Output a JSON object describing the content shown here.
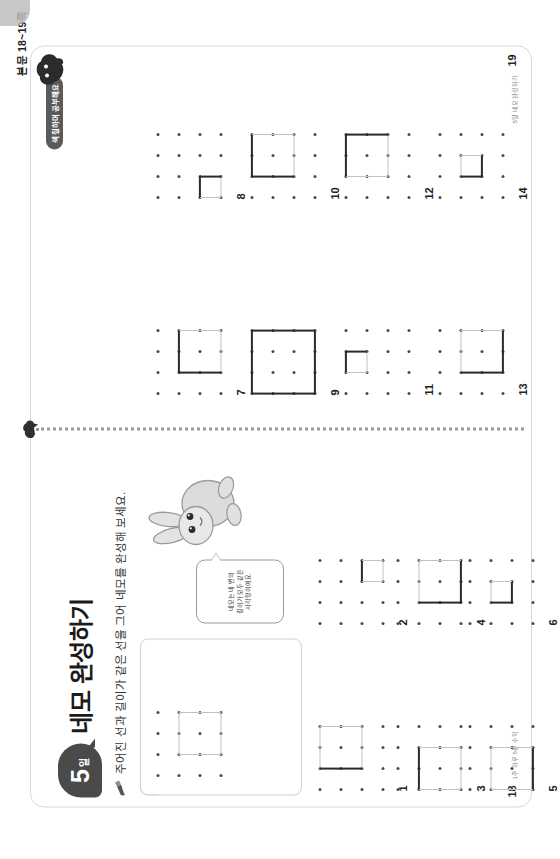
{
  "meta": {
    "runhead": "본문 18~19쪽",
    "rotation_deg": -90
  },
  "day_badge": {
    "number": "5",
    "unit": "일"
  },
  "title": "네모 완성하기",
  "instruction": "주어진 선과 길이가 같은 선을 그어 네모를 완성해 보세요.",
  "tab_pill": "색칠하며 공부해요",
  "bubble_text": "네모는 네 변의\n길이가 모두 같은\n사각형이에요.",
  "pages": {
    "left": {
      "number": "18",
      "sub": "1주 하루 5분 수학"
    },
    "right": {
      "number": "19",
      "sub": "5일 네모 완성하기"
    }
  },
  "icons": {
    "pencil": "pencil-icon",
    "rabbit": "rabbit-mascot-icon",
    "blob": "mascot-blob-icon"
  },
  "problems": [
    {
      "id": "example",
      "label": "",
      "cols": 4,
      "rows": 4,
      "square": {
        "c0": 1,
        "r0": 1,
        "w": 2,
        "h": 2
      },
      "given": [],
      "missing": [
        "top",
        "right",
        "bottom",
        "left"
      ]
    },
    {
      "id": "1",
      "label": "1",
      "cols": 4,
      "rows": 4,
      "square": {
        "c0": 1,
        "r0": 0,
        "w": 2,
        "h": 2
      },
      "given": [
        "left"
      ],
      "missing": [
        "top",
        "right",
        "bottom"
      ]
    },
    {
      "id": "2",
      "label": "2",
      "cols": 4,
      "rows": 4,
      "square": {
        "c0": 2,
        "r0": 2,
        "w": 1,
        "h": 1
      },
      "given": [
        "top"
      ],
      "missing": [
        "right",
        "bottom",
        "left"
      ]
    },
    {
      "id": "3",
      "label": "3",
      "cols": 4,
      "rows": 4,
      "square": {
        "c0": 0,
        "r0": 1,
        "w": 2,
        "h": 2
      },
      "given": [
        "top"
      ],
      "missing": [
        "right",
        "bottom",
        "left"
      ]
    },
    {
      "id": "4",
      "label": "4",
      "cols": 4,
      "rows": 4,
      "square": {
        "c0": 1,
        "r0": 1,
        "w": 2,
        "h": 2
      },
      "given": [
        "left",
        "bottom"
      ],
      "missing": [
        "top",
        "right"
      ]
    },
    {
      "id": "5",
      "label": "5",
      "cols": 4,
      "rows": 4,
      "square": {
        "c0": 0,
        "r0": 1,
        "w": 2,
        "h": 2
      },
      "given": [
        "bottom"
      ],
      "missing": [
        "top",
        "right",
        "left"
      ]
    },
    {
      "id": "6",
      "label": "6",
      "cols": 4,
      "rows": 4,
      "square": {
        "c0": 1,
        "r0": 1,
        "w": 1,
        "h": 1
      },
      "given": [
        "left",
        "bottom"
      ],
      "missing": [
        "top",
        "right"
      ]
    },
    {
      "id": "7",
      "label": "7",
      "cols": 4,
      "rows": 4,
      "square": {
        "c0": 1,
        "r0": 1,
        "w": 2,
        "h": 2
      },
      "given": [
        "top",
        "left"
      ],
      "missing": [
        "right",
        "bottom"
      ]
    },
    {
      "id": "8",
      "label": "8",
      "cols": 4,
      "rows": 4,
      "square": {
        "c0": 0,
        "r0": 2,
        "w": 1,
        "h": 1
      },
      "given": [
        "top",
        "right"
      ],
      "missing": [
        "bottom",
        "left"
      ]
    },
    {
      "id": "9",
      "label": "9",
      "cols": 4,
      "rows": 4,
      "square": {
        "c0": 0,
        "r0": 0,
        "w": 3,
        "h": 3
      },
      "given": [
        "top",
        "left",
        "bottom",
        "right"
      ],
      "missing": []
    },
    {
      "id": "10",
      "label": "10",
      "cols": 4,
      "rows": 4,
      "square": {
        "c0": 1,
        "r0": 0,
        "w": 2,
        "h": 2
      },
      "given": [
        "left",
        "top"
      ],
      "missing": [
        "right",
        "bottom"
      ]
    },
    {
      "id": "11",
      "label": "11",
      "cols": 4,
      "rows": 4,
      "square": {
        "c0": 1,
        "r0": 0,
        "w": 1,
        "h": 1
      },
      "given": [
        "top",
        "right"
      ],
      "missing": [
        "bottom",
        "left"
      ]
    },
    {
      "id": "12",
      "label": "12",
      "cols": 4,
      "rows": 4,
      "square": {
        "c0": 1,
        "r0": 0,
        "w": 2,
        "h": 2
      },
      "given": [
        "top",
        "right"
      ],
      "missing": [
        "bottom",
        "left"
      ]
    },
    {
      "id": "13",
      "label": "13",
      "cols": 4,
      "rows": 4,
      "square": {
        "c0": 1,
        "r0": 1,
        "w": 2,
        "h": 2
      },
      "given": [
        "left",
        "bottom"
      ],
      "missing": [
        "top",
        "right"
      ]
    },
    {
      "id": "14",
      "label": "14",
      "cols": 4,
      "rows": 4,
      "square": {
        "c0": 1,
        "r0": 1,
        "w": 1,
        "h": 1
      },
      "given": [
        "left",
        "bottom"
      ],
      "missing": [
        "top",
        "right"
      ]
    }
  ],
  "layout": {
    "note": "problem cells placed in the unrotated page coordinate system",
    "cells": {
      "example": {
        "x": 84,
        "y": 158
      },
      "1": {
        "x": 70,
        "y": 320
      },
      "2": {
        "x": 236,
        "y": 320
      },
      "3": {
        "x": 70,
        "y": 398
      },
      "4": {
        "x": 236,
        "y": 398
      },
      "5": {
        "x": 70,
        "y": 470
      },
      "6": {
        "x": 236,
        "y": 470
      },
      "7": {
        "x": 466,
        "y": 158
      },
      "8": {
        "x": 662,
        "y": 158
      },
      "9": {
        "x": 466,
        "y": 252
      },
      "10": {
        "x": 662,
        "y": 252
      },
      "11": {
        "x": 466,
        "y": 346
      },
      "12": {
        "x": 662,
        "y": 346
      },
      "13": {
        "x": 466,
        "y": 440
      },
      "14": {
        "x": 662,
        "y": 440
      }
    }
  },
  "colors": {
    "ink": "#2b2b2b",
    "dot": "#4a4a4a",
    "light_line": "#c2c2c2",
    "badge_bg": "#4a4a4a",
    "card_border": "#d8d8d8"
  }
}
